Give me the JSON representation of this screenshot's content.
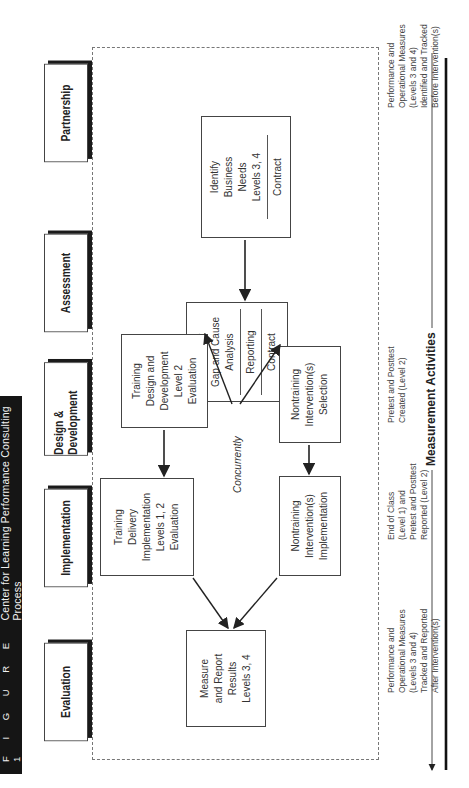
{
  "figure": {
    "label": "F I G U R E   1",
    "title": "Center for Learning Performance Consulting Process"
  },
  "phases": [
    {
      "id": "partnership",
      "label": "Partnership"
    },
    {
      "id": "assessment",
      "label": "Assessment"
    },
    {
      "id": "design-development",
      "label": "Design & Development"
    },
    {
      "id": "implementation",
      "label": "Implementation"
    },
    {
      "id": "evaluation",
      "label": "Evaluation"
    }
  ],
  "boxes": {
    "identify": {
      "lines": [
        "Identify",
        "Business",
        "Needs",
        "Levels 3, 4"
      ],
      "footer": "Contract"
    },
    "conduct": {
      "lines": [
        "Conduct",
        "Gap and Cause",
        "Analysis"
      ],
      "footer1": "Reporting",
      "footer2": "Contract"
    },
    "training_design": {
      "lines": [
        "Training",
        "Design and",
        "Development",
        "Level 2",
        "Evaluation"
      ]
    },
    "nontraining_selection": {
      "lines": [
        "Nontraining",
        "Intervention(s)",
        "Selection"
      ]
    },
    "training_delivery": {
      "lines": [
        "Training",
        "Delivery",
        "Implementation",
        "Levels 1, 2",
        "Evaluation"
      ]
    },
    "nontraining_implementation": {
      "lines": [
        "Nontraining",
        "Intervention(s)",
        "Implementation"
      ]
    },
    "measure": {
      "lines": [
        "Measure",
        "and Report",
        "Results",
        "Levels 3, 4"
      ]
    }
  },
  "concurrently_label": "Concurrently",
  "notes": {
    "before": [
      "Performance and",
      "Operational Measures",
      "(Levels 3 and 4)",
      "Identified and Tracked",
      "Before Intervention(s)"
    ],
    "pretest_created": [
      "Pretest and Posttest",
      "Created (Level 2)"
    ],
    "end_of_class": [
      "End of Class",
      "(Level 1) and",
      "Pretest and Posttest",
      "Reported (Level 2)"
    ],
    "after": [
      "Performance and",
      "Operational Measures",
      "(Levels 3 and 4)",
      "Tracked and Reported",
      "After Intervention(s)"
    ]
  },
  "measurement_activities_label": "Measurement Activities",
  "colors": {
    "title_bar": "#151515",
    "line": "#222222",
    "dashed_border": "#777777"
  }
}
